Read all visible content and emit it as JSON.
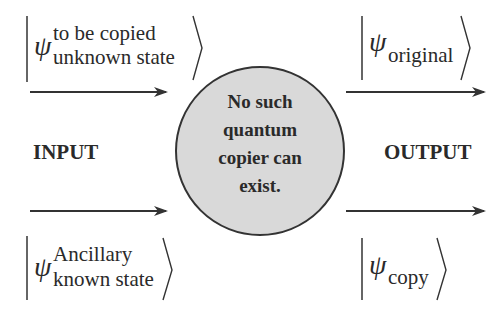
{
  "diagram": {
    "input_label": "INPUT",
    "output_label": "OUTPUT",
    "center": {
      "lines": [
        "No such",
        "quantum",
        "copier can",
        "exist."
      ],
      "fill": "#d9d9d9",
      "stroke": "#333333"
    },
    "inputs": [
      {
        "symbol": "ψ",
        "sup": "to be copied",
        "sub": "unknown state"
      },
      {
        "symbol": "ψ",
        "sup": "Ancillary",
        "sub": "known state"
      }
    ],
    "outputs": [
      {
        "symbol": "ψ",
        "sub": "original"
      },
      {
        "symbol": "ψ",
        "sub": "copy"
      }
    ],
    "arrow_color": "#333333"
  }
}
